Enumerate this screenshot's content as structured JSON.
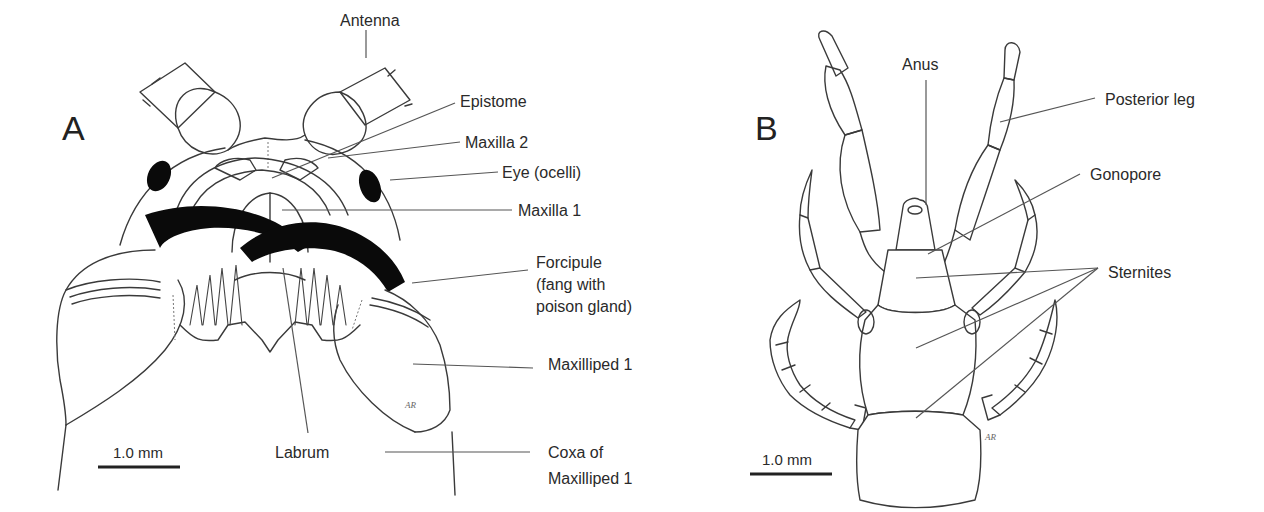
{
  "figure": {
    "panels": [
      {
        "id": "A",
        "letter": "A",
        "subject": "Centipede head, ventral view",
        "labels": {
          "antenna": "Antenna",
          "epistome": "Epistome",
          "maxilla2": "Maxilla 2",
          "eye": "Eye (ocelli)",
          "maxilla1": "Maxilla 1",
          "forcipule_l1": "Forcipule",
          "forcipule_l2": "(fang with",
          "forcipule_l3": "poison gland)",
          "maxilliped1": "Maxilliped 1",
          "labrum": "Labrum",
          "coxa_l1": "Coxa of",
          "coxa_l2": "Maxilliped 1"
        },
        "scale_bar": "1.0 mm",
        "signature": "AR"
      },
      {
        "id": "B",
        "letter": "B",
        "subject": "Centipede posterior end, ventral view",
        "labels": {
          "anus": "Anus",
          "posterior_leg": "Posterior leg",
          "gonopore": "Gonopore",
          "sternites": "Sternites"
        },
        "scale_bar": "1.0 mm",
        "signature": "AR"
      }
    ],
    "colors": {
      "line": "#3a3a3a",
      "fill_black": "#0a0a0a",
      "background": "#ffffff",
      "text": "#2a2a2a"
    }
  }
}
